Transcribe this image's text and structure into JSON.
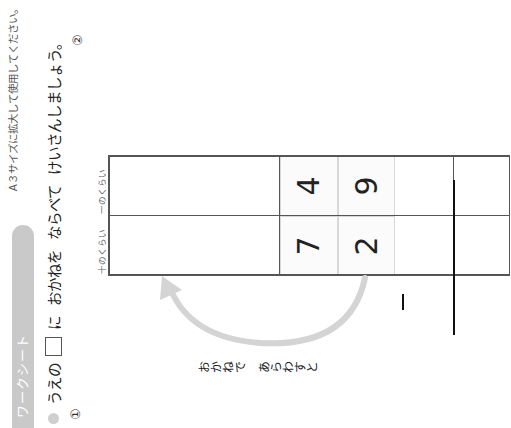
{
  "header": {
    "badge_label": "ワークシート",
    "print_note": "A３サイズに拡大して使用してください。"
  },
  "instruction": {
    "prefix": "うえの",
    "box_particle": "に",
    "word1": "おかねを",
    "word2": "ならべて",
    "word3": "けいさんしましょう。"
  },
  "problems": [
    {
      "label": "①"
    },
    {
      "label": "②"
    }
  ],
  "table": {
    "column_labels": [
      {
        "label": "十のくらい",
        "ruby": "じゅう"
      },
      {
        "label": "一のくらい",
        "ruby": "いち"
      }
    ],
    "rows": [
      {
        "tens": "7",
        "ones": "4"
      },
      {
        "tens": "2",
        "ones": "9"
      }
    ],
    "operator": "−"
  },
  "arrow": {
    "caption": "おかねで　あらわすと",
    "color": "#d4d4d4"
  },
  "colors": {
    "badge": "#c9c9c9",
    "line": "#555555",
    "answer_line": "#111111"
  }
}
